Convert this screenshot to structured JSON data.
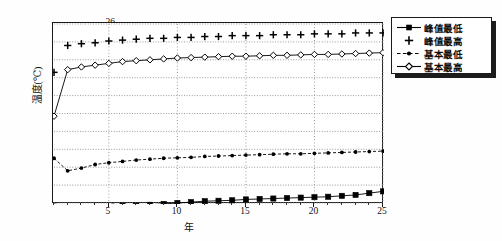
{
  "chart_data": {
    "type": "line",
    "title": "",
    "xlabel": "年",
    "ylabel": "温度(℃)",
    "xlim": [
      1,
      25
    ],
    "ylim": [
      6,
      26
    ],
    "ytick_labels": [
      "26",
      "24",
      "22",
      "20",
      "18",
      "16",
      "14",
      "12",
      "10",
      "8",
      "6"
    ],
    "ytick_values": [
      26,
      24,
      22,
      20,
      18,
      16,
      14,
      12,
      10,
      8,
      6
    ],
    "xtick_labels": [
      "5",
      "10",
      "15",
      "20",
      "25"
    ],
    "xtick_values": [
      5,
      10,
      15,
      20,
      25
    ],
    "grid": "dotted-both",
    "legend_position": "top-right-outside",
    "x": [
      1,
      2,
      3,
      4,
      5,
      6,
      7,
      8,
      9,
      10,
      11,
      12,
      13,
      14,
      15,
      16,
      17,
      18,
      19,
      20,
      21,
      22,
      23,
      24,
      25
    ],
    "series": [
      {
        "name": "峰值最低",
        "marker": "filled-square",
        "line": "solid",
        "values": [
          5.6,
          5.0,
          5.2,
          5.4,
          5.5,
          5.7,
          5.7,
          5.8,
          5.9,
          6.0,
          6.1,
          6.2,
          6.25,
          6.3,
          6.4,
          6.45,
          6.5,
          6.55,
          6.6,
          6.65,
          6.7,
          6.8,
          6.9,
          7.1,
          7.3
        ]
      },
      {
        "name": "峰值最高",
        "marker": "plus",
        "line": "none",
        "values": [
          20.6,
          23.6,
          23.8,
          23.9,
          24.1,
          24.2,
          24.3,
          24.4,
          24.4,
          24.5,
          24.5,
          24.6,
          24.6,
          24.7,
          24.7,
          24.7,
          24.8,
          24.8,
          24.8,
          24.9,
          24.9,
          24.9,
          25.0,
          25.0,
          25.0
        ]
      },
      {
        "name": "基本最低",
        "marker": "small-filled-circle",
        "line": "dashed",
        "values": [
          11.0,
          9.6,
          9.9,
          10.3,
          10.5,
          10.65,
          10.8,
          10.9,
          11.0,
          11.05,
          11.1,
          11.2,
          11.25,
          11.3,
          11.35,
          11.4,
          11.45,
          11.5,
          11.5,
          11.55,
          11.6,
          11.65,
          11.7,
          11.75,
          11.8
        ]
      },
      {
        "name": "基本最高",
        "marker": "open-diamond",
        "line": "solid",
        "values": [
          15.7,
          20.9,
          21.2,
          21.4,
          21.6,
          21.8,
          21.9,
          22.0,
          22.1,
          22.2,
          22.25,
          22.3,
          22.35,
          22.4,
          22.4,
          22.45,
          22.5,
          22.5,
          22.55,
          22.6,
          22.6,
          22.65,
          22.7,
          22.75,
          22.8
        ]
      }
    ]
  },
  "axes": {
    "y_label": "温度(℃)",
    "x_label": "年"
  },
  "legend": {
    "items": [
      {
        "label": "峰值最低",
        "marker": "filled-square"
      },
      {
        "label": "峰值最高",
        "marker": "plus"
      },
      {
        "label": "基本最低",
        "marker": "small-filled-circle"
      },
      {
        "label": "基本最高",
        "marker": "open-diamond"
      }
    ]
  },
  "colors": {
    "axis": "#1a1a1a",
    "grid": "#9a9a9a",
    "series": "#000000",
    "background": "#ffffff"
  }
}
